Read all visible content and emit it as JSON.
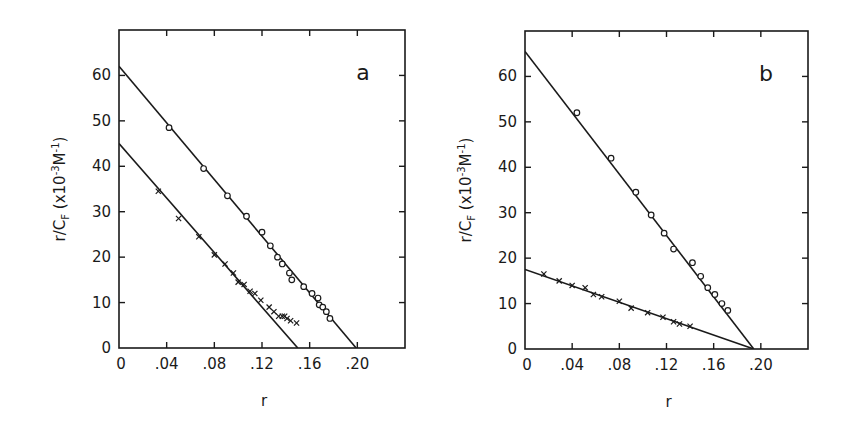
{
  "chart_data": [
    {
      "type": "scatter",
      "panel_label": "a",
      "title": "",
      "xlabel": "r",
      "ylabel": "r/C_F (x10^-3 M^-1)",
      "ylabel_parts": {
        "main": "r/C",
        "sub": "F",
        "unit_pre": "(x10",
        "unit_sup": "-3",
        "unit_mid": "M",
        "unit_sup2": "-1",
        "unit_post": ")"
      },
      "xlim": [
        0,
        0.24
      ],
      "ylim": [
        0,
        70
      ],
      "x_ticks": [
        0,
        0.04,
        0.08,
        0.12,
        0.16,
        0.2
      ],
      "x_tick_labels": [
        "0",
        ".04",
        ".08",
        ".12",
        ".16",
        ".20"
      ],
      "y_ticks": [
        0,
        10,
        20,
        30,
        40,
        50,
        60
      ],
      "y_tick_labels": [
        "0",
        "10",
        "20",
        "30",
        "40",
        "50",
        "60"
      ],
      "grid": false,
      "legend": null,
      "series": [
        {
          "name": "circles",
          "marker": "o",
          "x": [
            0.042,
            0.071,
            0.091,
            0.107,
            0.12,
            0.127,
            0.133,
            0.137,
            0.143,
            0.145,
            0.155,
            0.162,
            0.167,
            0.168,
            0.171,
            0.174,
            0.177
          ],
          "y": [
            48.5,
            39.5,
            33.5,
            29.0,
            25.5,
            22.5,
            20.0,
            18.5,
            16.5,
            15.0,
            13.5,
            12.0,
            11.0,
            9.5,
            9.0,
            8.0,
            6.5
          ],
          "fit_line": {
            "x0": 0,
            "y0": 62,
            "x1": 0.199,
            "y1": 0
          }
        },
        {
          "name": "crosses",
          "marker": "x",
          "x": [
            0.033,
            0.05,
            0.067,
            0.08,
            0.089,
            0.096,
            0.1,
            0.105,
            0.11,
            0.114,
            0.119,
            0.126,
            0.13,
            0.134,
            0.137,
            0.139,
            0.141,
            0.144,
            0.149
          ],
          "y": [
            34.5,
            28.5,
            24.5,
            20.5,
            18.5,
            16.5,
            14.5,
            14.0,
            12.5,
            12.0,
            10.5,
            9.0,
            8.0,
            7.0,
            7.0,
            7.0,
            6.5,
            6.0,
            5.5
          ],
          "fit_line": {
            "x0": 0,
            "y0": 45,
            "x1": 0.15,
            "y1": 0
          }
        }
      ]
    },
    {
      "type": "scatter",
      "panel_label": "b",
      "title": "",
      "xlabel": "r",
      "ylabel": "r/C_F (x10^-3 M^-1)",
      "ylabel_parts": {
        "main": "r/C",
        "sub": "F",
        "unit_pre": "(x10",
        "unit_sup": "-3",
        "unit_mid": "M",
        "unit_sup2": "-1",
        "unit_post": ")"
      },
      "xlim": [
        0,
        0.24
      ],
      "ylim": [
        0,
        70
      ],
      "x_ticks": [
        0,
        0.04,
        0.08,
        0.12,
        0.16,
        0.2
      ],
      "x_tick_labels": [
        "0",
        ".04",
        ".08",
        ".12",
        ".16",
        ".20"
      ],
      "y_ticks": [
        0,
        10,
        20,
        30,
        40,
        50,
        60
      ],
      "y_tick_labels": [
        "0",
        "10",
        "20",
        "30",
        "40",
        "50",
        "60"
      ],
      "grid": false,
      "legend": null,
      "series": [
        {
          "name": "circles",
          "marker": "o",
          "x": [
            0.044,
            0.073,
            0.094,
            0.107,
            0.118,
            0.126,
            0.142,
            0.149,
            0.155,
            0.161,
            0.167,
            0.172
          ],
          "y": [
            52.0,
            42.0,
            34.5,
            29.5,
            25.5,
            22.0,
            19.0,
            16.0,
            13.5,
            12.0,
            10.0,
            8.5
          ],
          "fit_line": {
            "x0": 0,
            "y0": 65.5,
            "x1": 0.194,
            "y1": 0
          }
        },
        {
          "name": "crosses",
          "marker": "x",
          "x": [
            0.016,
            0.029,
            0.04,
            0.051,
            0.058,
            0.065,
            0.08,
            0.09,
            0.104,
            0.117,
            0.126,
            0.131,
            0.14
          ],
          "y": [
            16.5,
            15.0,
            14.0,
            13.5,
            12.0,
            11.5,
            10.5,
            9.0,
            8.0,
            7.0,
            6.0,
            5.5,
            5.0
          ],
          "fit_line": {
            "x0": 0,
            "y0": 17.5,
            "x1": 0.194,
            "y1": 0
          }
        }
      ]
    }
  ]
}
